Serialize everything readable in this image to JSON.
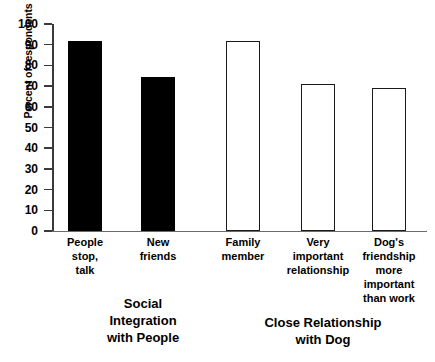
{
  "chart_data": {
    "type": "bar",
    "title": "",
    "xlabel": "",
    "ylabel": "Percent of respondents",
    "ylim": [
      0,
      100
    ],
    "ytick_step": 10,
    "grid": false,
    "legend": "none",
    "categories": [
      "People\nstop,\ntalk",
      "New\nfriends",
      "Family\nmember",
      "Very\nimportant\nrelationship",
      "Dog's\nfriendship\nmore\nimportant\nthan work"
    ],
    "values": [
      92,
      74.5,
      92,
      71,
      69
    ],
    "bar_styles": [
      "filled",
      "filled",
      "hollow",
      "hollow",
      "hollow"
    ],
    "yticks": [
      0,
      10,
      20,
      30,
      40,
      50,
      60,
      70,
      80,
      90,
      100
    ],
    "ytick_labels": [
      "0",
      "10",
      "20",
      "30",
      "40",
      "50",
      "60",
      "70",
      "80",
      "90",
      "100"
    ],
    "groups": [
      {
        "label": "Social\nIntegration\nwith People",
        "categories": [
          0,
          1
        ]
      },
      {
        "label": "Close Relationship\nwith Dog",
        "categories": [
          2,
          3,
          4
        ]
      }
    ],
    "colors": {
      "filled": "#000000",
      "hollow_fill": "#ffffff",
      "hollow_stroke": "#1a1a1a",
      "axis": "#3a3a3a",
      "baseline": "#6b6b6b",
      "background": "#ffffff",
      "text": "#000000"
    }
  }
}
